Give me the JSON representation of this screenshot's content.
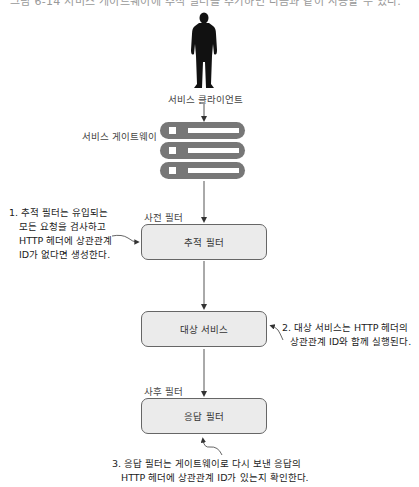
{
  "header": {
    "cutoff_caption": "그림 6-14 서비스 게이트웨이에 추적 필터를 추가하면 다음과 같이 사용할 수 있다."
  },
  "client": {
    "icon": "person-silhouette-icon",
    "label": "서비스 클라이언트"
  },
  "gateway": {
    "label": "서비스 게이트웨이",
    "icon": "server-stack-icon",
    "bar_count": 3,
    "bar_color": "#777777"
  },
  "pre_filter": {
    "section_label": "사전 필터",
    "box_label": "추적 필터"
  },
  "target_service": {
    "box_label": "대상 서비스"
  },
  "post_filter": {
    "section_label": "사후 필터",
    "box_label": "응답 필터"
  },
  "annotations": [
    {
      "number": "1.",
      "lines": [
        "1. 추적 필터는 유입되는",
        "모든 요청을 검사하고",
        "HTTP 헤더에 상관관계",
        "ID가 없다면 생성한다."
      ]
    },
    {
      "number": "2.",
      "lines": [
        "2. 대상 서비스는 HTTP 헤더의",
        "상관관계 ID와 함께 실행된다."
      ]
    },
    {
      "number": "3.",
      "lines": [
        "3. 응답 필터는 게이트웨이로 다시 보낸 응답의",
        "HTTP 헤더에 상관관계 ID가 있는지 확인한다."
      ]
    }
  ],
  "colors": {
    "box_fill": "#ebebeb",
    "box_border": "#666666",
    "arrow": "#333333"
  }
}
